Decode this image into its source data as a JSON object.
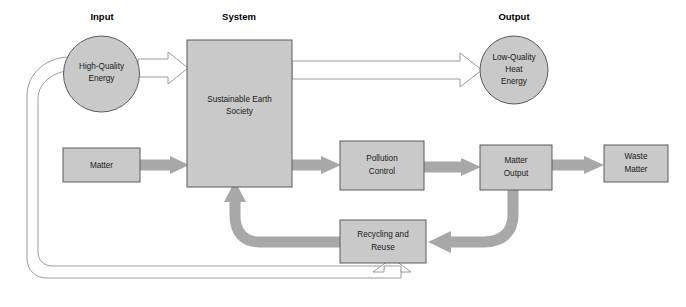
{
  "diagram": {
    "type": "flow-diagram",
    "colors": {
      "node_fill": "#c9c9c9",
      "node_stroke": "#5a5a5a",
      "thick_arrow": "#a8a8a8",
      "hollow_arrow_stroke": "#9a9a9a",
      "background": "#ffffff",
      "text": "#1a1a1a"
    },
    "section_labels": [
      {
        "id": "input",
        "text": "Input",
        "x": 102,
        "y": 17
      },
      {
        "id": "system",
        "text": "System",
        "x": 239,
        "y": 17
      },
      {
        "id": "output",
        "text": "Output",
        "x": 514,
        "y": 17
      }
    ],
    "nodes": [
      {
        "id": "high-quality-energy",
        "shape": "circle",
        "lines": [
          "High-Quality",
          "Energy"
        ],
        "cx": 101.5,
        "cy": 74,
        "r": 38
      },
      {
        "id": "sustainable-earth-society",
        "shape": "rect",
        "lines": [
          "Sustainable Earth",
          "Society"
        ],
        "x": 187,
        "y": 40,
        "w": 105,
        "h": 147
      },
      {
        "id": "low-quality-heat-energy",
        "shape": "circle",
        "lines": [
          "Low-Quality",
          "Heat",
          "Energy"
        ],
        "cx": 514,
        "cy": 70,
        "r": 34
      },
      {
        "id": "matter",
        "shape": "rect",
        "lines": [
          "Matter"
        ],
        "x": 63,
        "y": 148,
        "w": 77,
        "h": 34
      },
      {
        "id": "pollution-control",
        "shape": "rect",
        "lines": [
          "Pollution",
          "Control"
        ],
        "x": 340,
        "y": 141,
        "w": 84,
        "h": 49
      },
      {
        "id": "matter-output",
        "shape": "rect",
        "lines": [
          "Matter",
          "Output"
        ],
        "x": 480,
        "y": 145,
        "w": 72,
        "h": 45
      },
      {
        "id": "waste-matter",
        "shape": "rect",
        "lines": [
          "Waste",
          "Matter"
        ],
        "x": 604,
        "y": 145,
        "w": 64,
        "h": 37
      },
      {
        "id": "recycling-and-reuse",
        "shape": "rect",
        "lines": [
          "Recycling and",
          "Reuse"
        ],
        "x": 340,
        "y": 220,
        "w": 86,
        "h": 43
      }
    ],
    "flows": [
      {
        "id": "energy-to-system",
        "from": "high-quality-energy",
        "to": "sustainable-earth-society",
        "style": "hollow"
      },
      {
        "id": "system-to-heat-energy",
        "from": "sustainable-earth-society",
        "to": "low-quality-heat-energy",
        "style": "hollow"
      },
      {
        "id": "matter-to-system",
        "from": "matter",
        "to": "sustainable-earth-society",
        "style": "solid"
      },
      {
        "id": "system-to-pollution-control",
        "from": "sustainable-earth-society",
        "to": "pollution-control",
        "style": "solid"
      },
      {
        "id": "pollution-control-to-matter-output",
        "from": "pollution-control",
        "to": "matter-output",
        "style": "solid"
      },
      {
        "id": "matter-output-to-waste-matter",
        "from": "matter-output",
        "to": "waste-matter",
        "style": "solid"
      },
      {
        "id": "matter-output-to-recycling",
        "from": "matter-output",
        "to": "recycling-and-reuse",
        "style": "solid-curved"
      },
      {
        "id": "recycling-to-system",
        "from": "recycling-and-reuse",
        "to": "sustainable-earth-society",
        "style": "solid-curved"
      },
      {
        "id": "energy-feedback-to-recycling",
        "from": "high-quality-energy",
        "to": "recycling-and-reuse",
        "style": "hollow-loop"
      }
    ]
  }
}
